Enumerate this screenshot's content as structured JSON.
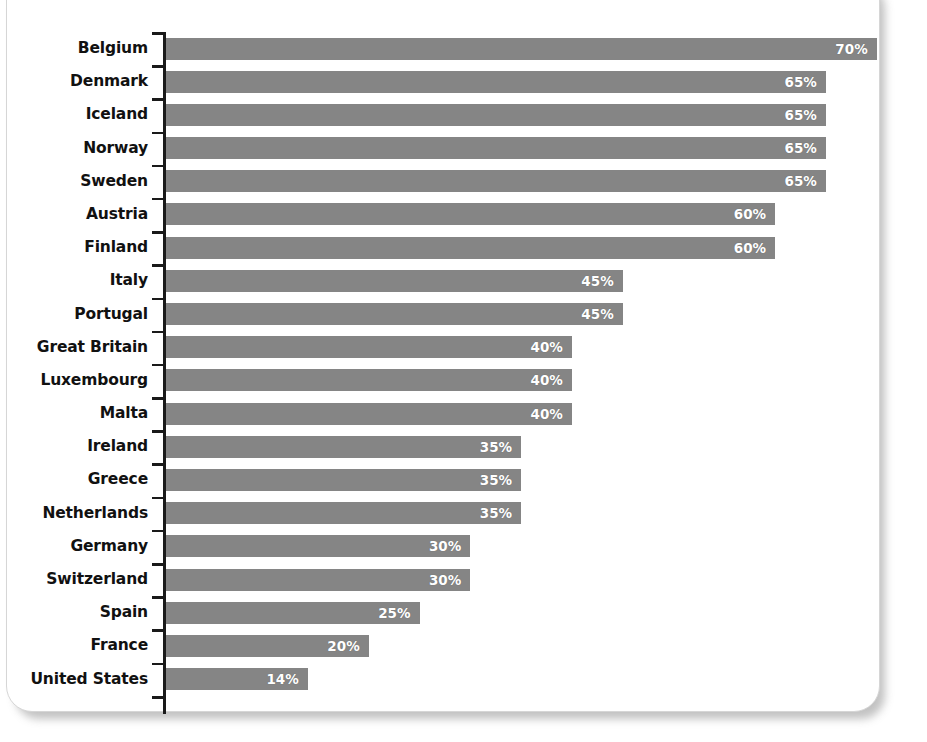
{
  "chart_data": {
    "type": "bar",
    "orientation": "horizontal",
    "title": "",
    "subtitle": "",
    "xlabel": "",
    "ylabel": "",
    "grid": false,
    "legend": null,
    "xlim": [
      0,
      70
    ],
    "value_suffix": "%",
    "bar_color": "#858585",
    "value_label_color": "#ffffff",
    "category_label_color": "#111111",
    "axis_color": "#1a1a1a",
    "categories": [
      "Belgium",
      "Denmark",
      "Iceland",
      "Norway",
      "Sweden",
      "Austria",
      "Finland",
      "Italy",
      "Portugal",
      "Great Britain",
      "Luxembourg",
      "Malta",
      "Ireland",
      "Greece",
      "Netherlands",
      "Germany",
      "Switzerland",
      "Spain",
      "France",
      "United States"
    ],
    "values": [
      70,
      65,
      65,
      65,
      65,
      60,
      60,
      45,
      45,
      40,
      40,
      40,
      35,
      35,
      35,
      30,
      30,
      25,
      20,
      14
    ],
    "value_labels": [
      "70%",
      "65%",
      "65%",
      "65%",
      "65%",
      "60%",
      "60%",
      "45%",
      "45%",
      "40%",
      "40%",
      "40%",
      "35%",
      "35%",
      "35%",
      "30%",
      "30%",
      "25%",
      "20%",
      "14%"
    ],
    "rows": [
      {
        "category": "Belgium",
        "value": 70,
        "label": "70%"
      },
      {
        "category": "Denmark",
        "value": 65,
        "label": "65%"
      },
      {
        "category": "Iceland",
        "value": 65,
        "label": "65%"
      },
      {
        "category": "Norway",
        "value": 65,
        "label": "65%"
      },
      {
        "category": "Sweden",
        "value": 65,
        "label": "65%"
      },
      {
        "category": "Austria",
        "value": 60,
        "label": "60%"
      },
      {
        "category": "Finland",
        "value": 60,
        "label": "60%"
      },
      {
        "category": "Italy",
        "value": 45,
        "label": "45%"
      },
      {
        "category": "Portugal",
        "value": 45,
        "label": "45%"
      },
      {
        "category": "Great Britain",
        "value": 40,
        "label": "40%"
      },
      {
        "category": "Luxembourg",
        "value": 40,
        "label": "40%"
      },
      {
        "category": "Malta",
        "value": 40,
        "label": "40%"
      },
      {
        "category": "Ireland",
        "value": 35,
        "label": "35%"
      },
      {
        "category": "Greece",
        "value": 35,
        "label": "35%"
      },
      {
        "category": "Netherlands",
        "value": 35,
        "label": "35%"
      },
      {
        "category": "Germany",
        "value": 30,
        "label": "30%"
      },
      {
        "category": "Switzerland",
        "value": 30,
        "label": "30%"
      },
      {
        "category": "Spain",
        "value": 25,
        "label": "25%"
      },
      {
        "category": "France",
        "value": 20,
        "label": "20%"
      },
      {
        "category": "United States",
        "value": 14,
        "label": "14%"
      }
    ]
  }
}
